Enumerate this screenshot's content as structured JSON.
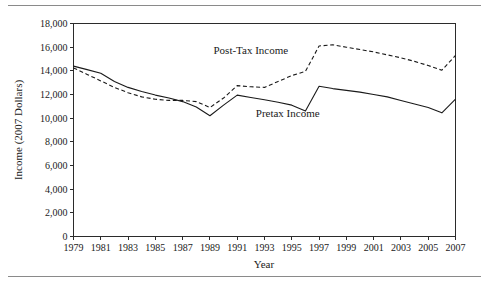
{
  "figure": {
    "top_rule": "horizontal-rule",
    "bottom_rule": "horizontal-rule"
  },
  "chart_data": {
    "type": "line",
    "title": "",
    "xlabel": "Year",
    "ylabel": "Income (2007 Dollars)",
    "xlim": [
      1979,
      2007
    ],
    "ylim": [
      0,
      18000
    ],
    "grid": false,
    "legend": "inline-annotations",
    "ytick_labels": [
      "0",
      "2,000",
      "4,000",
      "6,000",
      "8,000",
      "10,000",
      "12,000",
      "14,000",
      "16,000",
      "18,000"
    ],
    "ytick_values": [
      0,
      2000,
      4000,
      6000,
      8000,
      10000,
      12000,
      14000,
      16000,
      18000
    ],
    "xtick_labels": [
      "1979",
      "1981",
      "1983",
      "1985",
      "1987",
      "1989",
      "1991",
      "1993",
      "1995",
      "1997",
      "1999",
      "2001",
      "2003",
      "2005",
      "2007"
    ],
    "xtick_values": [
      1979,
      1981,
      1983,
      1985,
      1987,
      1989,
      1991,
      1993,
      1995,
      1997,
      1999,
      2001,
      2003,
      2005,
      2007
    ],
    "x": [
      1979,
      1980,
      1981,
      1982,
      1983,
      1984,
      1985,
      1986,
      1987,
      1988,
      1989,
      1990,
      1991,
      1992,
      1993,
      1994,
      1995,
      1996,
      1997,
      1998,
      1999,
      2000,
      2001,
      2002,
      2003,
      2004,
      2005,
      2006,
      2007
    ],
    "series": [
      {
        "name": "Post-Tax Income",
        "style": "dashed",
        "color": "#1a1a1a",
        "label_text": "Post-Tax Income",
        "values": [
          14250,
          13700,
          13150,
          12600,
          12150,
          11800,
          11600,
          11500,
          11500,
          11400,
          10900,
          11700,
          12750,
          12650,
          12600,
          13100,
          13600,
          13950,
          16100,
          16200,
          16000,
          15800,
          15600,
          15350,
          15100,
          14800,
          14450,
          14050,
          15300
        ]
      },
      {
        "name": "Pretax Income",
        "style": "solid",
        "color": "#1a1a1a",
        "label_text": "Pretax Income",
        "values": [
          14400,
          14100,
          13800,
          13100,
          12600,
          12250,
          11950,
          11700,
          11400,
          10950,
          10200,
          11100,
          11950,
          11750,
          11550,
          11350,
          11100,
          10600,
          12700,
          12500,
          12350,
          12200,
          12000,
          11800,
          11500,
          11200,
          10900,
          10450,
          11600
        ]
      }
    ],
    "annotations": [
      {
        "text": "Post-Tax Income",
        "x": 1992.0,
        "y": 15400
      },
      {
        "text": "Pretax Income",
        "x": 1994.7,
        "y": 10100
      }
    ]
  }
}
